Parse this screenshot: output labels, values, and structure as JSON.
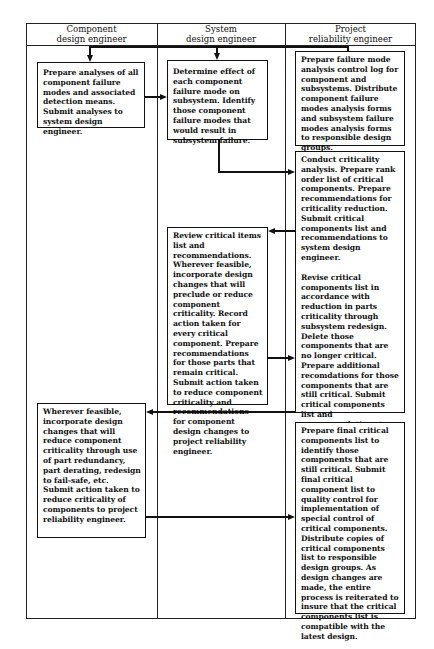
{
  "diagram": {
    "type": "swimlane-flowchart",
    "lanes": [
      {
        "id": "component",
        "header_line1": "Component",
        "header_line2": "design engineer"
      },
      {
        "id": "system",
        "header_line1": "System",
        "header_line2": "design engineer"
      },
      {
        "id": "project",
        "header_line1": "Project",
        "header_line2": "reliability engineer"
      }
    ],
    "boxes": {
      "A": {
        "lane": "component",
        "text": "Prepare analyses of all component failure modes and associated detection means. Submit analyses to system design engineer."
      },
      "B": {
        "lane": "system",
        "text": "Determine effect of each component failure mode on subsystem. Identify those component failure modes that would result in subsystem failure."
      },
      "C": {
        "lane": "project",
        "text": "Prepare failure mode analysis control log for component and subsystems. Distribute component failure modes analysis forms and subsystem failure modes analysis forms to responsible design groups."
      },
      "D": {
        "lane": "project",
        "text1": "Conduct criticality analysis. Prepare rank order list of critical components. Prepare recommendations for criticality reduction. Submit critical components list and recommendations to system design engineer.",
        "text2": "Revise critical components list in accordance with reduction in parts criticality through subsystem redesign. Delete those components that are no longer critical. Prepare additional recomdations for those components that are still critical. Submit critical components list and recommendations to component designers."
      },
      "E": {
        "lane": "system",
        "text": "Review critical items list and recommendations. Wherever feasible, incorporate design changes that will preclude or reduce component criticality. Record action taken for every critical component. Prepare recommendations for those parts that remain critical. Submit action taken to reduce component criticality and recommendations for component design changes to project reliability engineer."
      },
      "F": {
        "lane": "component",
        "text": "Wherever feasible, incorporate design changes that will reduce component criticality through use of part redundancy, part derating, redesign to fail-safe, etc. Submit action taken to reduce criticality of components to project reliability engineer."
      },
      "G": {
        "lane": "project",
        "text": "Prepare final critical components list to identify those components that are still critical. Submit final critical component list to quality control for implementation of special control of critical components. Distribute copies of critical components list to responsible design groups. As design changes are made, the entire process is reiterated to insure that the critical components list is compatible with the latest design."
      }
    },
    "connections": [
      {
        "from": "C",
        "to": "A",
        "label": ""
      },
      {
        "from": "C",
        "to": "B",
        "label": ""
      },
      {
        "from": "A",
        "to": "B",
        "label": ""
      },
      {
        "from": "B",
        "to": "D",
        "label": ""
      },
      {
        "from": "D",
        "to": "E",
        "label": ""
      },
      {
        "from": "E",
        "to": "D",
        "label": ""
      },
      {
        "from": "D",
        "to": "F",
        "label": ""
      },
      {
        "from": "F",
        "to": "G",
        "label": ""
      }
    ]
  }
}
